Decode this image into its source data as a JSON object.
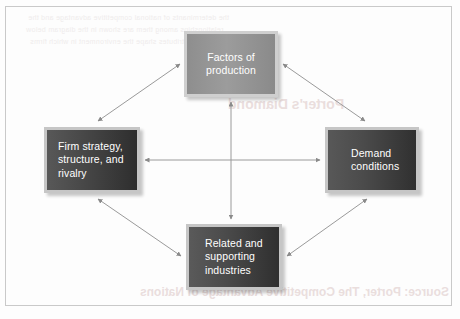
{
  "figure": {
    "type": "diamond-model",
    "border_color": "#c9c9c9",
    "background_color": "#fdfdfd",
    "arrow_color": "#8a8a8a"
  },
  "nodes": {
    "factors": {
      "id": "factors-of-production",
      "lines": [
        "Factors of",
        "production"
      ],
      "position": "top",
      "fill": "#949494",
      "frame": "#cfcfcf",
      "text_color": "#ffffff",
      "align": "center"
    },
    "firm": {
      "id": "firm-strategy-structure-rivalry",
      "lines": [
        "Firm strategy,",
        "structure, and",
        "rivalry"
      ],
      "position": "left",
      "fill": "#3d3d3d",
      "frame": "#c6c6c6",
      "text_color": "#ffffff",
      "align": "left"
    },
    "demand": {
      "id": "demand-conditions",
      "lines": [
        "Demand",
        "conditions"
      ],
      "position": "right",
      "fill": "#3f3f3f",
      "frame": "#c6c6c6",
      "text_color": "#ffffff",
      "align": "left"
    },
    "related": {
      "id": "related-and-supporting-industries",
      "lines": [
        "Related and",
        "supporting",
        "industries"
      ],
      "position": "bottom",
      "fill": "#404040",
      "frame": "#c6c6c6",
      "text_color": "#ffffff",
      "align": "left"
    }
  },
  "connections": [
    {
      "id": "firm-factors",
      "from": "firm",
      "to": "factors",
      "style": "double-arrow",
      "orientation": "diagonal"
    },
    {
      "id": "factors-demand",
      "from": "factors",
      "to": "demand",
      "style": "double-arrow",
      "orientation": "diagonal"
    },
    {
      "id": "firm-related",
      "from": "firm",
      "to": "related",
      "style": "double-arrow",
      "orientation": "diagonal"
    },
    {
      "id": "related-demand",
      "from": "related",
      "to": "demand",
      "style": "double-arrow",
      "orientation": "diagonal"
    },
    {
      "id": "firm-demand",
      "from": "firm",
      "to": "demand",
      "style": "double-arrow",
      "orientation": "horizontal"
    },
    {
      "id": "factors-related",
      "from": "factors",
      "to": "related",
      "style": "double-arrow",
      "orientation": "vertical"
    }
  ],
  "bleed_through": {
    "note": "faint mirrored text showing through from the reverse side of the printed page",
    "heading": "Porter's Diamond",
    "footer": "Source: Porter, The Competitive Advantage of Nations",
    "body_lines": [
      "the determinants of national competitive advantage and the",
      "relationships among them are shown in the diagram below",
      "these four attributes shape the environment in which firms"
    ]
  }
}
